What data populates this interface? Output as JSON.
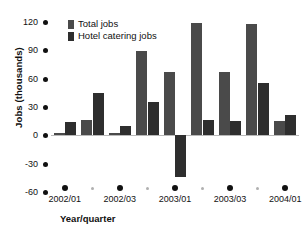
{
  "chart_data": {
    "type": "bar",
    "title": "",
    "xlabel": "Year/quarter",
    "ylabel": "Jobs (thousands)",
    "ylim": [
      -60,
      120
    ],
    "yticks": [
      120,
      90,
      60,
      30,
      0,
      -30,
      -60
    ],
    "ytick_labels": [
      "120",
      "90",
      "60",
      "30",
      "0",
      "-30",
      "-60"
    ],
    "grid": false,
    "legend_position": "top-left",
    "categories": [
      "2002/Q1",
      "2002/Q2",
      "2002/Q3",
      "2002/Q4",
      "2003/Q1",
      "2003/Q2",
      "2003/Q3",
      "2003/Q4",
      "2004/Q1"
    ],
    "xtick_labels": [
      "2002/01",
      "2002/03",
      "2003/01",
      "2003/03",
      "2004/01"
    ],
    "xtick_labelled_indices": [
      0,
      2,
      4,
      6,
      8
    ],
    "series": [
      {
        "name": "Total jobs",
        "color": "#4a4a4a",
        "values": [
          3,
          16,
          3,
          89,
          67,
          119,
          67,
          118,
          15
        ]
      },
      {
        "name": "Hotel catering jobs",
        "color": "#2e2e2e",
        "values": [
          14,
          45,
          10,
          35,
          -44,
          16,
          15,
          55,
          22
        ]
      }
    ]
  },
  "legend": {
    "items": [
      {
        "label": "Total jobs"
      },
      {
        "label": "Hotel catering jobs"
      }
    ]
  },
  "axes": {
    "y_title": "Jobs (thousands)",
    "x_title": "Year/quarter"
  }
}
